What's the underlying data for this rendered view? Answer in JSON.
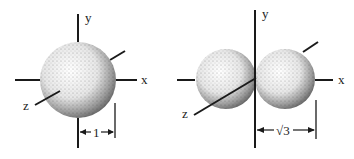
{
  "figures": [
    {
      "name": "single-sphere",
      "axis_labels": {
        "x": "x",
        "y": "y",
        "z": "z"
      },
      "dimension_label": "1"
    },
    {
      "name": "double-sphere",
      "axis_labels": {
        "x": "x",
        "y": "y",
        "z": "z"
      },
      "dimension_label": "√3"
    }
  ],
  "colors": {
    "ink": "#1a1a1a",
    "background": "#ffffff"
  }
}
